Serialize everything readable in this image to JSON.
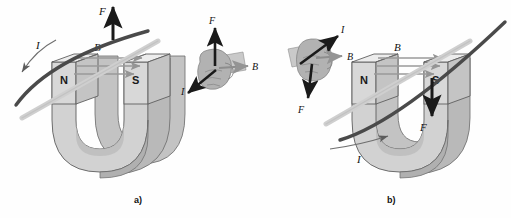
{
  "figure": {
    "background_color": "#fefefe",
    "panels": [
      {
        "id": "a",
        "caption": "a)",
        "magnet": {
          "type": "horseshoe-magnet",
          "body_color": "#d0d0d0",
          "shade_color": "#b4b4b4",
          "top_color": "#e6e6e6",
          "outline_color": "#5a5a5a",
          "poles": [
            {
              "label": "N",
              "side": "left"
            },
            {
              "label": "S",
              "side": "right"
            }
          ]
        },
        "field": {
          "label": "B",
          "arrow_count": 3,
          "direction": "left-to-right (N to S)",
          "color": "#9a9a9a"
        },
        "conductor": {
          "label": "I",
          "current_direction": "down-left",
          "wire_color": "#4a4a4a",
          "rod_color": "#c8c8c8"
        },
        "force": {
          "label": "F",
          "direction": "up",
          "color": "#1a1a1a"
        },
        "hand": {
          "present": true,
          "fill": "#b0b0b0",
          "palm_fill": "#c2c2c2",
          "vectors": [
            {
              "label": "F",
              "direction": "up"
            },
            {
              "label": "B",
              "direction": "right"
            },
            {
              "label": "I",
              "direction": "down-left"
            }
          ]
        }
      },
      {
        "id": "b",
        "caption": "b)",
        "magnet": {
          "type": "horseshoe-magnet",
          "body_color": "#d0d0d0",
          "shade_color": "#b4b4b4",
          "top_color": "#e6e6e6",
          "outline_color": "#5a5a5a",
          "poles": [
            {
              "label": "N",
              "side": "left"
            },
            {
              "label": "S",
              "side": "right"
            }
          ]
        },
        "field": {
          "label": "B",
          "arrow_count": 3,
          "direction": "left-to-right (N to S)",
          "color": "#9a9a9a"
        },
        "conductor": {
          "label": "I",
          "current_direction": "up-right",
          "wire_color": "#4a4a4a",
          "rod_color": "#c8c8c8"
        },
        "force": {
          "label": "F",
          "direction": "down",
          "color": "#1a1a1a"
        },
        "hand": {
          "present": true,
          "fill": "#b0b0b0",
          "palm_fill": "#c2c2c2",
          "vectors": [
            {
              "label": "I",
              "direction": "up-right"
            },
            {
              "label": "B",
              "direction": "right"
            },
            {
              "label": "F",
              "direction": "down"
            }
          ]
        }
      }
    ]
  }
}
